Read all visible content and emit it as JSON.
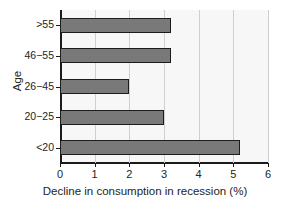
{
  "chart_data": {
    "type": "bar",
    "orientation": "horizontal",
    "title": "",
    "xlabel": "Decline in consumption in recession (%)",
    "ylabel": "Age",
    "categories": [
      "<20",
      "20−25",
      "26−45",
      "46−55",
      ">55"
    ],
    "values": [
      5.2,
      3.0,
      2.0,
      3.2,
      3.2
    ],
    "xlim": [
      0,
      6
    ],
    "xticks": [
      0,
      1,
      2,
      3,
      4,
      5,
      6
    ],
    "xticklabels": [
      "0",
      "1",
      "2",
      "3",
      "4",
      "5",
      "6"
    ],
    "grid": "vertical",
    "legend": "none",
    "bar_color": "#797979",
    "bar_edge_color": "#1c1c1c",
    "plot_background": "#f7f7f7",
    "axis_color": "#1a1a1a",
    "gridline_color": "#cfcfcf"
  }
}
